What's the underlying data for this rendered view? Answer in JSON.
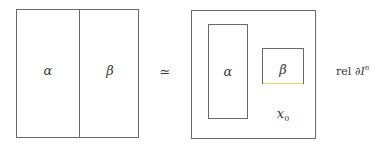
{
  "left_square": {
    "left_label": "α",
    "right_label": "β"
  },
  "relation_symbol": "≃",
  "right_square": {
    "alpha_label": "α",
    "beta_label": "β",
    "basepoint_label": "x",
    "basepoint_subscript": "0"
  },
  "relative_text": {
    "rel": "rel",
    "partial": "∂",
    "I": "I",
    "superscript": "n"
  },
  "colors": {
    "stroke": "#6a6a6a",
    "beta_bottom_edge": "#e8d860"
  }
}
